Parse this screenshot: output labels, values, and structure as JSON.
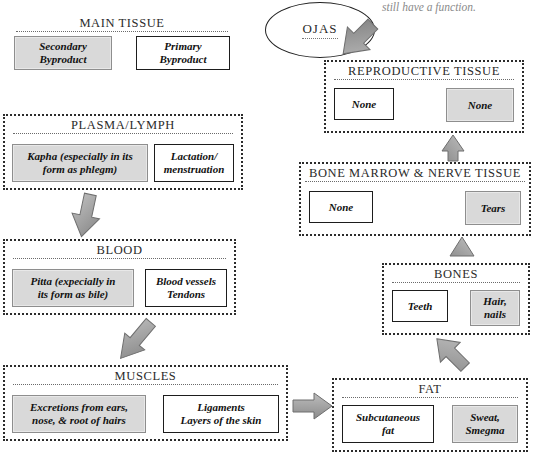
{
  "diagram": {
    "note": "still have a function.",
    "ojas": {
      "label": "OJAS",
      "name": "ojas-node"
    },
    "colors": {
      "shaded_box_fill": "#d9d9d9",
      "shaded_box_border": "#8e8e8e",
      "solid_box_border": "#1d1d1d",
      "section_border": "#2b2b2b",
      "arrow_fill": "#9a9a9a",
      "note_text": "#8a8a8a"
    },
    "sections": [
      {
        "id": "main-tissue",
        "title": "MAIN TISSUE",
        "secondary": "Secondary\nByproduct",
        "secondary_line1": "Secondary",
        "secondary_line2": "Byproduct",
        "primary_line1": "Primary",
        "primary_line2": "Byproduct"
      },
      {
        "id": "plasma-lymph",
        "title": "PLASMA/LYMPH",
        "secondary_line1": "Kapha (especially in its",
        "secondary_line2": "form as phlegm)",
        "primary_line1": "Lactation/",
        "primary_line2": "menstruation"
      },
      {
        "id": "blood",
        "title": "BLOOD",
        "secondary_line1": "Pitta (expecially in",
        "secondary_line2": "its form as bile)",
        "primary_line1": "Blood vessels",
        "primary_line2": "Tendons"
      },
      {
        "id": "muscles",
        "title": "MUSCLES",
        "secondary_line1": "Excretions from ears,",
        "secondary_line2": "nose, & root of hairs",
        "primary_line1": "Ligaments",
        "primary_line2": "Layers of the skin"
      },
      {
        "id": "fat",
        "title": "FAT",
        "primary_line1": "Subcutaneous",
        "primary_line2": "fat",
        "secondary_line1": "Sweat,",
        "secondary_line2": "Smegma"
      },
      {
        "id": "bones",
        "title": "BONES",
        "primary_line1": "Teeth",
        "primary_line2": "",
        "secondary_line1": "Hair,",
        "secondary_line2": "nails"
      },
      {
        "id": "bone-marrow-nerve",
        "title": "BONE MARROW & NERVE TISSUE",
        "primary_line1": "None",
        "primary_line2": "",
        "secondary_line1": "Tears",
        "secondary_line2": ""
      },
      {
        "id": "reproductive-tissue",
        "title": "REPRODUCTIVE TISSUE",
        "primary_line1": "None",
        "primary_line2": "",
        "secondary_line1": "None",
        "secondary_line2": ""
      }
    ],
    "arrows": [
      {
        "id": "plasma-to-blood",
        "direction": "down"
      },
      {
        "id": "blood-to-muscles",
        "direction": "down-right"
      },
      {
        "id": "muscles-to-fat",
        "direction": "right"
      },
      {
        "id": "fat-to-bones",
        "direction": "up-left"
      },
      {
        "id": "bones-to-marrow",
        "direction": "up"
      },
      {
        "id": "marrow-to-reproductive",
        "direction": "up"
      },
      {
        "id": "reproductive-to-ojas",
        "direction": "up-left"
      }
    ]
  }
}
